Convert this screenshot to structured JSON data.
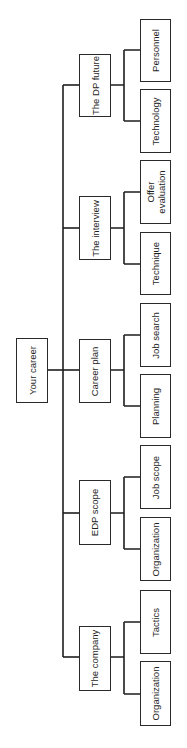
{
  "diagram": {
    "type": "tree / organization chart (rotated 90°)",
    "root": {
      "label": "Your career"
    },
    "branches": [
      {
        "label": "The DP future",
        "children": [
          {
            "label": "Personnel"
          },
          {
            "label": "Technology"
          }
        ]
      },
      {
        "label": "The interview",
        "children": [
          {
            "label": "Offer\nevaluation"
          },
          {
            "label": "Technique"
          }
        ]
      },
      {
        "label": "Career plan",
        "children": [
          {
            "label": "Job search"
          },
          {
            "label": "Planning"
          }
        ]
      },
      {
        "label": "EDP scope",
        "children": [
          {
            "label": "Job scope"
          },
          {
            "label": "Organization"
          }
        ]
      },
      {
        "label": "The company",
        "children": [
          {
            "label": "Tactics"
          },
          {
            "label": "Organization"
          }
        ]
      }
    ]
  },
  "colors": {
    "line": "#1e1e1e",
    "box_border": "#2a2a2a",
    "background": "#ffffff"
  }
}
